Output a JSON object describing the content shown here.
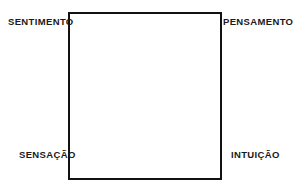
{
  "diagram": {
    "shape": "square",
    "border_color": "#121212",
    "background_color": "#ffffff",
    "text_color": "#1a1a1a",
    "corners": {
      "top_left": "SENTIMENTO",
      "top_right": "PENSAMENTO",
      "bottom_left": "SENSAÇÃO",
      "bottom_right": "INTUIÇÃO"
    }
  }
}
